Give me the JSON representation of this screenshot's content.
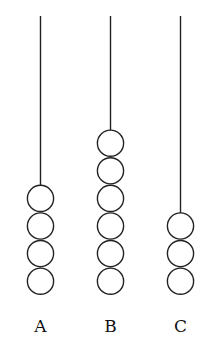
{
  "diagram": {
    "type": "abacus-rods",
    "rod_top_y": 16,
    "bead_base_y": 295,
    "bead_diameter": 27.6,
    "rods": [
      {
        "label": "A",
        "x": 40.5,
        "beads": 4
      },
      {
        "label": "B",
        "x": 110.5,
        "beads": 6
      },
      {
        "label": "C",
        "x": 180.5,
        "beads": 3
      }
    ],
    "label_y": 332
  }
}
